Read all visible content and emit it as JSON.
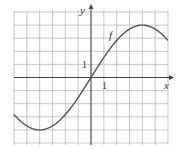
{
  "chart_data": {
    "type": "line",
    "title": "",
    "xlabel": "x",
    "ylabel": "y",
    "xlim": [
      -6,
      6
    ],
    "ylim": [
      -5,
      5
    ],
    "grid": true,
    "legend": null,
    "annotations": [
      {
        "text": "f",
        "x": 3.3,
        "y": 3.2
      },
      {
        "text": "1",
        "axis": "y",
        "value": 1
      },
      {
        "text": "1",
        "axis": "x",
        "value": 1
      }
    ],
    "series": [
      {
        "name": "f",
        "x": [
          -6,
          -5,
          -4,
          -3,
          -2,
          -1,
          0,
          1,
          2,
          3,
          4,
          5,
          6
        ],
        "values": [
          -2.3,
          -3.6,
          -4.0,
          -3.6,
          -2.6,
          -1.3,
          0,
          1.3,
          2.6,
          3.6,
          4.0,
          3.6,
          2.3
        ]
      }
    ]
  },
  "labels": {
    "x_axis": "x",
    "y_axis": "y",
    "curve": "f",
    "x_tick": "1",
    "y_tick": "1"
  },
  "colors": {
    "grid": "#b8b8b8",
    "axis": "#444444",
    "curve": "#555555"
  }
}
